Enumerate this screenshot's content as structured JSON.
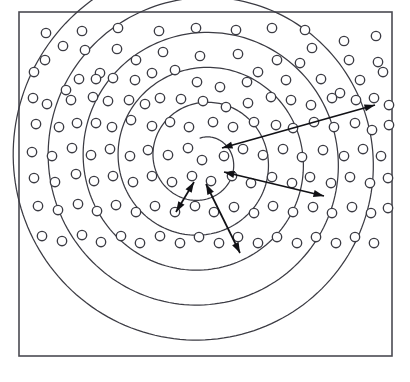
{
  "figure": {
    "canvas": {
      "width": 410,
      "height": 382
    },
    "background_color": "#ffffff",
    "line_color": "#3b3b43",
    "frame_color": "#4a4a52",
    "arrow_color": "#111115",
    "marker_fill": "#ffffff"
  },
  "frame": {
    "x": 19,
    "y": 12,
    "width": 373,
    "height": 344,
    "stroke_width": 1.6
  },
  "chart_data": {
    "type": "scatter",
    "xlabel": "",
    "ylabel": "",
    "xlim": [
      19,
      392
    ],
    "ylim": [
      12,
      356
    ],
    "grid": false,
    "legend": null,
    "center": {
      "x": 202,
      "y": 160
    },
    "spiral": {
      "description": "Five-turn logarithmic-like spiral drawn as open arcs about the center",
      "turns": 5,
      "inner_radius": 22,
      "outer_radius": 196,
      "growth_per_turn": 35,
      "start_angle_deg": -95,
      "end_angle_deg": 1760,
      "arm_end_upper_left": {
        "x": 72,
        "y": 28
      },
      "arm_end_upper_right": {
        "x": 335,
        "y": 28
      }
    },
    "rings_vertical_crossings_above_center": [
      25,
      60,
      92,
      118,
      138
    ],
    "rings_vertical_crossings_below_center": [
      183,
      210,
      243,
      283,
      322
    ],
    "marker_radius": 4.7,
    "marker_count": 150,
    "markers": [
      [
        46,
        33
      ],
      [
        82,
        31
      ],
      [
        118,
        28
      ],
      [
        159,
        31
      ],
      [
        196,
        28
      ],
      [
        236,
        30
      ],
      [
        272,
        28
      ],
      [
        305,
        30
      ],
      [
        344,
        41
      ],
      [
        376,
        36
      ],
      [
        45,
        60
      ],
      [
        63,
        46
      ],
      [
        85,
        50
      ],
      [
        100,
        73
      ],
      [
        117,
        49
      ],
      [
        136,
        60
      ],
      [
        163,
        52
      ],
      [
        200,
        56
      ],
      [
        238,
        54
      ],
      [
        277,
        60
      ],
      [
        312,
        48
      ],
      [
        349,
        60
      ],
      [
        378,
        62
      ],
      [
        34,
        72
      ],
      [
        66,
        90
      ],
      [
        79,
        79
      ],
      [
        96,
        79
      ],
      [
        113,
        78
      ],
      [
        135,
        80
      ],
      [
        152,
        73
      ],
      [
        175,
        70
      ],
      [
        197,
        82
      ],
      [
        220,
        87
      ],
      [
        247,
        82
      ],
      [
        258,
        72
      ],
      [
        286,
        80
      ],
      [
        300,
        63
      ],
      [
        321,
        79
      ],
      [
        340,
        93
      ],
      [
        360,
        80
      ],
      [
        383,
        72
      ],
      [
        33,
        98
      ],
      [
        47,
        104
      ],
      [
        71,
        100
      ],
      [
        93,
        97
      ],
      [
        108,
        101
      ],
      [
        129,
        100
      ],
      [
        145,
        104
      ],
      [
        160,
        98
      ],
      [
        181,
        99
      ],
      [
        203,
        101
      ],
      [
        226,
        107
      ],
      [
        248,
        103
      ],
      [
        271,
        97
      ],
      [
        291,
        100
      ],
      [
        311,
        105
      ],
      [
        332,
        98
      ],
      [
        356,
        100
      ],
      [
        374,
        98
      ],
      [
        389,
        105
      ],
      [
        36,
        124
      ],
      [
        59,
        127
      ],
      [
        77,
        123
      ],
      [
        96,
        123
      ],
      [
        112,
        127
      ],
      [
        131,
        120
      ],
      [
        152,
        126
      ],
      [
        170,
        122
      ],
      [
        189,
        127
      ],
      [
        213,
        122
      ],
      [
        233,
        127
      ],
      [
        254,
        122
      ],
      [
        276,
        125
      ],
      [
        293,
        128
      ],
      [
        314,
        122
      ],
      [
        334,
        127
      ],
      [
        355,
        123
      ],
      [
        372,
        130
      ],
      [
        389,
        125
      ],
      [
        32,
        152
      ],
      [
        52,
        156
      ],
      [
        72,
        148
      ],
      [
        91,
        155
      ],
      [
        110,
        149
      ],
      [
        130,
        156
      ],
      [
        148,
        150
      ],
      [
        168,
        155
      ],
      [
        188,
        148
      ],
      [
        202,
        160
      ],
      [
        224,
        156
      ],
      [
        243,
        149
      ],
      [
        263,
        155
      ],
      [
        283,
        149
      ],
      [
        302,
        157
      ],
      [
        323,
        150
      ],
      [
        344,
        156
      ],
      [
        363,
        149
      ],
      [
        381,
        156
      ],
      [
        34,
        178
      ],
      [
        55,
        182
      ],
      [
        76,
        174
      ],
      [
        94,
        181
      ],
      [
        113,
        176
      ],
      [
        133,
        182
      ],
      [
        152,
        176
      ],
      [
        172,
        182
      ],
      [
        192,
        176
      ],
      [
        211,
        181
      ],
      [
        232,
        176
      ],
      [
        251,
        183
      ],
      [
        272,
        177
      ],
      [
        292,
        183
      ],
      [
        310,
        177
      ],
      [
        331,
        183
      ],
      [
        350,
        177
      ],
      [
        370,
        183
      ],
      [
        388,
        178
      ],
      [
        38,
        206
      ],
      [
        58,
        210
      ],
      [
        78,
        204
      ],
      [
        97,
        211
      ],
      [
        116,
        205
      ],
      [
        136,
        212
      ],
      [
        155,
        206
      ],
      [
        175,
        212
      ],
      [
        195,
        206
      ],
      [
        214,
        212
      ],
      [
        234,
        207
      ],
      [
        254,
        213
      ],
      [
        273,
        206
      ],
      [
        293,
        212
      ],
      [
        313,
        207
      ],
      [
        332,
        213
      ],
      [
        352,
        207
      ],
      [
        371,
        213
      ],
      [
        388,
        208
      ],
      [
        42,
        236
      ],
      [
        62,
        241
      ],
      [
        82,
        235
      ],
      [
        101,
        242
      ],
      [
        121,
        236
      ],
      [
        140,
        243
      ],
      [
        160,
        236
      ],
      [
        180,
        243
      ],
      [
        199,
        237
      ],
      [
        219,
        243
      ],
      [
        238,
        237
      ],
      [
        258,
        243
      ],
      [
        277,
        237
      ],
      [
        297,
        243
      ],
      [
        316,
        237
      ],
      [
        336,
        243
      ],
      [
        355,
        237
      ],
      [
        374,
        243
      ]
    ],
    "arrows": [
      {
        "name": "outermost-radius-arrow",
        "from": {
          "x": 375,
          "y": 105
        },
        "to": {
          "x": 222,
          "y": 148
        },
        "double_headed": true,
        "label": ""
      },
      {
        "name": "second-radius-arrow",
        "from": {
          "x": 324,
          "y": 196
        },
        "to": {
          "x": 224,
          "y": 172
        },
        "double_headed": true,
        "label": ""
      },
      {
        "name": "third-radius-arrow",
        "from": {
          "x": 240,
          "y": 253
        },
        "to": {
          "x": 206,
          "y": 184
        },
        "double_headed": true,
        "label": ""
      },
      {
        "name": "innermost-radius-arrow",
        "from": {
          "x": 176,
          "y": 212
        },
        "to": {
          "x": 194,
          "y": 182
        },
        "double_headed": true,
        "label": ""
      }
    ]
  }
}
